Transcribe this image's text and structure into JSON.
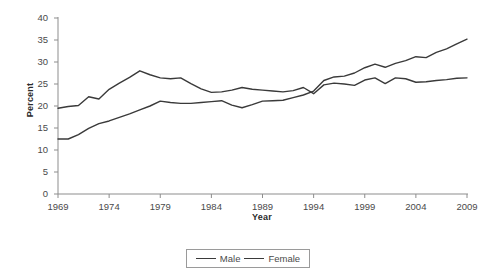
{
  "chart_data": {
    "type": "line",
    "title": "",
    "xlabel": "Year",
    "ylabel": "Percent",
    "xlim": [
      1969,
      2009
    ],
    "ylim": [
      0,
      40
    ],
    "ytick_labels": [
      "0",
      "5",
      "10",
      "15",
      "20",
      "25",
      "30",
      "35",
      "40"
    ],
    "ytick_values": [
      0,
      5,
      10,
      15,
      20,
      25,
      30,
      35,
      40
    ],
    "xtick_labels": [
      "1969",
      "1974",
      "1979",
      "1984",
      "1989",
      "1994",
      "1999",
      "2004",
      "2009"
    ],
    "xtick_values": [
      1969,
      1974,
      1979,
      1984,
      1989,
      1994,
      1999,
      2004,
      2009
    ],
    "grid": false,
    "legend_position": "bottom-center",
    "x": [
      1969,
      1970,
      1971,
      1972,
      1973,
      1974,
      1975,
      1976,
      1977,
      1978,
      1979,
      1980,
      1981,
      1982,
      1983,
      1984,
      1985,
      1986,
      1987,
      1988,
      1989,
      1990,
      1991,
      1992,
      1993,
      1994,
      1995,
      1996,
      1997,
      1998,
      1999,
      2000,
      2001,
      2002,
      2003,
      2004,
      2005,
      2006,
      2007,
      2008,
      2009
    ],
    "series": [
      {
        "name": "Male",
        "color": "#3a3a3a",
        "values": [
          19.5,
          19.9,
          20.1,
          22.1,
          21.6,
          23.8,
          25.2,
          26.5,
          28.0,
          27.1,
          26.4,
          26.2,
          26.4,
          25.1,
          23.9,
          23.1,
          23.2,
          23.6,
          24.2,
          23.8,
          23.6,
          23.4,
          23.2,
          23.5,
          24.2,
          22.8,
          24.8,
          25.2,
          25.0,
          24.7,
          25.9,
          26.4,
          25.1,
          26.4,
          26.2,
          25.4,
          25.5,
          25.8,
          26.0,
          26.3,
          26.4
        ]
      },
      {
        "name": "Female",
        "color": "#3a3a3a",
        "values": [
          12.5,
          12.5,
          13.5,
          14.9,
          16.0,
          16.6,
          17.4,
          18.2,
          19.1,
          20.0,
          21.1,
          20.8,
          20.6,
          20.6,
          20.8,
          21.0,
          21.2,
          20.2,
          19.6,
          20.3,
          21.1,
          21.2,
          21.3,
          21.9,
          22.5,
          23.4,
          25.8,
          26.6,
          26.8,
          27.5,
          28.7,
          29.5,
          28.8,
          29.7,
          30.3,
          31.2,
          31.0,
          32.2,
          33.0,
          34.1,
          35.2
        ]
      }
    ]
  },
  "axis": {
    "ylabel": "Percent",
    "xlabel": "Year"
  },
  "legend": {
    "items": [
      {
        "label": "Male"
      },
      {
        "label": "Female"
      }
    ]
  }
}
